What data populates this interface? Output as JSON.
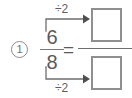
{
  "problem": {
    "number_label": "1",
    "equals_label": "=",
    "fraction": {
      "numerator": "6",
      "denominator": "8"
    },
    "answer": {
      "numerator_value": "",
      "denominator_value": ""
    },
    "operations": {
      "top_label": "÷2",
      "bottom_label": "÷2"
    },
    "colors": {
      "ink": "#5a5a5a",
      "rule": "#7a7a7a",
      "box_border": "#8f8f8f",
      "background": "#ffffff"
    }
  }
}
